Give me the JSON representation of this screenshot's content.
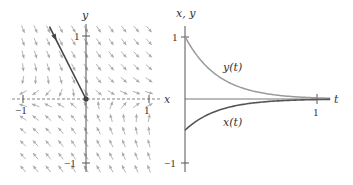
{
  "phase_plane": {
    "x_label": "x",
    "y_label": "y",
    "x_ticks": [
      {
        "value": -1,
        "label": "−1"
      },
      {
        "value": 1,
        "label": "1"
      }
    ],
    "y_ticks": [
      {
        "value": 1,
        "label": "1"
      },
      {
        "value": -1,
        "label": "−1"
      }
    ],
    "x_range": [
      -1.0,
      1.0
    ],
    "y_range": [
      -1.1,
      1.2
    ],
    "field_grid_step": 0.2,
    "field_matrix": [
      [
        1,
        2.5
      ],
      [
        0,
        -4
      ]
    ],
    "trajectory": {
      "from": [
        -0.58,
        1.14
      ],
      "to": [
        0,
        0
      ]
    },
    "equilibrium": [
      0,
      0
    ],
    "colors": {
      "axis": "#555555",
      "field": "#aaaaaa",
      "trajectory": "#444444"
    }
  },
  "time_plot": {
    "y_axis_label": "x, y",
    "t_label": "t",
    "t_ticks": [
      {
        "value": 1,
        "label": "1"
      }
    ],
    "y_ticks": [
      {
        "value": 1,
        "label": "1"
      },
      {
        "value": -1,
        "label": "−1"
      }
    ],
    "t_range": [
      0,
      1.1
    ],
    "y_range": [
      -1.05,
      1.2
    ],
    "curves": [
      {
        "name": "y(t)",
        "label": "y(t)",
        "initial": 1.0,
        "decay_rate": 4,
        "color": "#9a9a9a"
      },
      {
        "name": "x(t)",
        "label": "x(t)",
        "initial": -0.5,
        "decay_rate": 4,
        "color": "#555555"
      }
    ],
    "colors": {
      "axis": "#555555"
    }
  }
}
